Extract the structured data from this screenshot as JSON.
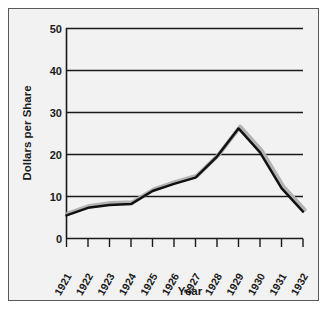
{
  "chart_data": {
    "type": "line",
    "title": "",
    "subtitle": "",
    "xlabel": "Year",
    "ylabel": "Dollars per Share",
    "x": [
      1921,
      1922,
      1923,
      1924,
      1925,
      1926,
      1927,
      1928,
      1929,
      1930,
      1931,
      1932
    ],
    "xtick_labels": [
      "1921",
      "1922",
      "1923",
      "1924",
      "1925",
      "1926",
      "1927",
      "1928",
      "1929",
      "1930",
      "1931",
      "1932"
    ],
    "ytick_labels": [
      "0",
      "10",
      "20",
      "30",
      "40",
      "50"
    ],
    "yticks": [
      0,
      10,
      20,
      30,
      40,
      50
    ],
    "ylim": [
      0,
      50
    ],
    "xlim": [
      1921,
      1932
    ],
    "grid": "horizontal",
    "legend": "none",
    "series": [
      {
        "name": "Dollars per Share",
        "values": [
          5.5,
          7.3,
          8.0,
          8.2,
          11.3,
          13.0,
          14.5,
          19.5,
          26.2,
          20.5,
          12.0,
          6.4
        ],
        "color": "#111111",
        "shadow_color": "#b3b3b3"
      }
    ],
    "annotations": [],
    "colors": {
      "figure_background": "#ffffff",
      "panel_background": "#f2f2f2",
      "frame_border": "#595959",
      "axis": "#1a1a1a",
      "gridline": "#1a1a1a"
    }
  }
}
